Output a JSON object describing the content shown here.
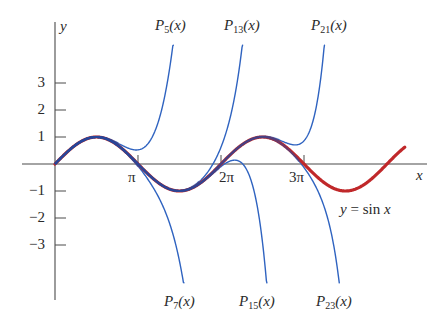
{
  "chart_data": {
    "type": "line",
    "title": "",
    "xlabel": "x",
    "ylabel": "y",
    "x_ticks": [
      {
        "value": 3.14159,
        "label": "π"
      },
      {
        "value": 6.28319,
        "label": "2π"
      },
      {
        "value": 9.42478,
        "label": "3π"
      }
    ],
    "y_ticks": [
      {
        "value": 3,
        "label": "3"
      },
      {
        "value": 2,
        "label": "2"
      },
      {
        "value": 1,
        "label": "1"
      },
      {
        "value": -1,
        "label": "−1"
      },
      {
        "value": -2,
        "label": "−2"
      },
      {
        "value": -3,
        "label": "−3"
      }
    ],
    "xlim": [
      -1.25,
      14.1
    ],
    "ylim": [
      -5.1,
      5.3
    ],
    "clip_y": 4.4,
    "grid": false,
    "series": [
      {
        "name": "y = sin x",
        "function": "sin",
        "x_range": [
          0,
          13.25
        ],
        "color": "#c0282a",
        "width": 3.2
      },
      {
        "name": "P5(x)",
        "function": "taylor_sin",
        "order": 5,
        "color": "#2f63c0",
        "width": 1.4
      },
      {
        "name": "P7(x)",
        "function": "taylor_sin",
        "order": 7,
        "color": "#2f63c0",
        "width": 1.4
      },
      {
        "name": "P13(x)",
        "function": "taylor_sin",
        "order": 13,
        "color": "#2f63c0",
        "width": 1.4
      },
      {
        "name": "P15(x)",
        "function": "taylor_sin",
        "order": 15,
        "color": "#2f63c0",
        "width": 1.4
      },
      {
        "name": "P21(x)",
        "function": "taylor_sin",
        "order": 21,
        "color": "#2f63c0",
        "width": 1.4
      },
      {
        "name": "P23(x)",
        "function": "taylor_sin",
        "order": 23,
        "color": "#2f63c0",
        "width": 1.4
      }
    ],
    "annotations": [
      {
        "text": "y = sin x",
        "near": [
          10.9,
          -1.9
        ]
      }
    ]
  },
  "labels": {
    "y_axis": "y",
    "x_axis": "x",
    "sin_label_y": "y",
    "sin_label_eq": " = sin ",
    "sin_label_x": "x",
    "top": [
      {
        "p": "P",
        "sub": "5",
        "arg": "(x)"
      },
      {
        "p": "P",
        "sub": "13",
        "arg": "(x)"
      },
      {
        "p": "P",
        "sub": "21",
        "arg": "(x)"
      }
    ],
    "bottom": [
      {
        "p": "P",
        "sub": "7",
        "arg": "(x)"
      },
      {
        "p": "P",
        "sub": "15",
        "arg": "(x)"
      },
      {
        "p": "P",
        "sub": "23",
        "arg": "(x)"
      }
    ],
    "y_ticks": [
      "3",
      "2",
      "1",
      "−1",
      "−2",
      "−3"
    ],
    "x_ticks": [
      "π",
      "2π",
      "3π"
    ]
  }
}
